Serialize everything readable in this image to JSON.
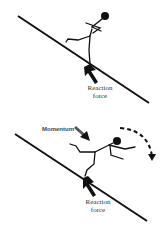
{
  "panels": [
    {
      "id": "standing",
      "labels": {
        "reaction_force": [
          "Reaction",
          "force"
        ]
      }
    },
    {
      "id": "falling",
      "labels": {
        "momentum": "Momentum",
        "reaction_force": [
          "Reaction",
          "force"
        ]
      }
    }
  ],
  "colors": {
    "ink": "#111111",
    "label": "#333333",
    "background": "#ffffff"
  }
}
